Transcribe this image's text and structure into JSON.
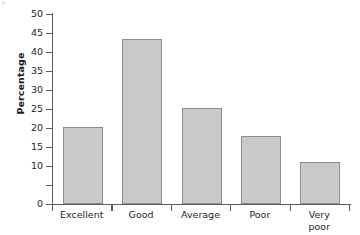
{
  "chart_data": {
    "type": "bar",
    "title": "",
    "xlabel": "",
    "ylabel": "Percentage",
    "categories": [
      "Excellent",
      "Good",
      "Average",
      "Poor",
      "Very\npoor"
    ],
    "category_labels": [
      {
        "line1": "Excellent",
        "line2": ""
      },
      {
        "line1": "Good",
        "line2": ""
      },
      {
        "line1": "Average",
        "line2": ""
      },
      {
        "line1": "Poor",
        "line2": ""
      },
      {
        "line1": "Very",
        "line2": "poor"
      }
    ],
    "values": [
      20.3,
      43.5,
      25.3,
      18.0,
      11.0
    ],
    "ylim": [
      0,
      50
    ],
    "ytick_step": 5,
    "yticks": [
      0,
      5,
      10,
      15,
      20,
      25,
      30,
      35,
      40,
      45,
      50
    ],
    "ytick_labels": [
      "0",
      "5",
      "10",
      "15",
      "20",
      "25",
      "30",
      "35",
      "40",
      "45",
      "50"
    ],
    "ytick_labels_shown": [
      "0",
      "10",
      "15",
      "20",
      "25",
      "30",
      "35",
      "40",
      "45",
      "50"
    ],
    "grid": false,
    "legend": null,
    "bar_fill_color": "#c9c9c9",
    "bar_border_color": "#8e8e8e",
    "axis_color": "#5d5d5d",
    "text_color": "#262626",
    "background_color": "#ffffff"
  }
}
